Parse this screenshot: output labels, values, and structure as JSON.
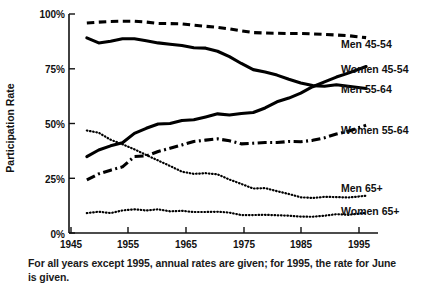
{
  "chart_data": {
    "type": "line",
    "title": "",
    "xlabel": "",
    "ylabel": "Participation Rate",
    "xlim": [
      1945,
      1997
    ],
    "ylim": [
      0,
      100
    ],
    "grid": false,
    "legend_position": "right-inline",
    "x_tick_labels": [
      "1945",
      "1955",
      "1965",
      "1975",
      "1985",
      "1995"
    ],
    "x_ticks": [
      1945,
      1955,
      1965,
      1975,
      1985,
      1995
    ],
    "y_tick_labels": [
      "0%",
      "25%",
      "50%",
      "75%",
      "100%"
    ],
    "y_ticks": [
      0,
      25,
      50,
      75,
      100
    ],
    "x": [
      1948,
      1950,
      1952,
      1954,
      1956,
      1958,
      1960,
      1962,
      1964,
      1966,
      1968,
      1970,
      1972,
      1974,
      1976,
      1978,
      1980,
      1982,
      1984,
      1986,
      1988,
      1990,
      1992,
      1995
    ],
    "series": [
      {
        "name": "Men 45-54",
        "style": "dashed",
        "values": [
          95.9,
          96.3,
          96.6,
          96.7,
          96.7,
          96.3,
          95.7,
          95.6,
          95.5,
          94.9,
          94.4,
          93.9,
          93.2,
          92.3,
          91.5,
          91.3,
          91.2,
          91.1,
          91.1,
          90.9,
          90.7,
          90.4,
          90.1,
          89.2
        ]
      },
      {
        "name": "Men 55-64",
        "style": "solid",
        "values": [
          89.1,
          86.8,
          87.6,
          88.7,
          88.7,
          87.8,
          86.8,
          86.2,
          85.6,
          84.6,
          84.4,
          83.0,
          80.5,
          77.4,
          74.6,
          73.5,
          72.1,
          70.2,
          68.5,
          67.3,
          67.0,
          67.7,
          67.0,
          66.0
        ]
      },
      {
        "name": "Women 45-54",
        "style": "solid",
        "values": [
          34.9,
          37.9,
          39.8,
          41.2,
          45.5,
          47.8,
          49.8,
          50.0,
          51.4,
          51.7,
          53.0,
          54.4,
          53.9,
          54.6,
          55.0,
          57.1,
          59.9,
          61.6,
          63.9,
          66.8,
          69.0,
          71.2,
          73.0,
          76.0
        ]
      },
      {
        "name": "Women 55-64",
        "style": "dashdot",
        "values": [
          24.3,
          27.0,
          28.7,
          30.2,
          34.9,
          35.2,
          37.2,
          38.7,
          40.2,
          41.8,
          42.4,
          43.0,
          42.1,
          40.7,
          41.0,
          41.3,
          41.3,
          41.8,
          41.7,
          42.3,
          43.5,
          45.2,
          46.5,
          49.2
        ]
      },
      {
        "name": "Men 65+",
        "style": "dotted",
        "values": [
          46.8,
          45.8,
          42.6,
          40.5,
          38.2,
          35.6,
          33.1,
          30.6,
          28.0,
          27.0,
          27.3,
          26.8,
          24.4,
          22.4,
          20.3,
          20.5,
          19.1,
          17.8,
          16.3,
          16.0,
          16.5,
          16.4,
          16.2,
          17.0
        ]
      },
      {
        "name": "Women 65+",
        "style": "dotted",
        "values": [
          9.1,
          9.7,
          9.1,
          10.3,
          10.8,
          10.3,
          10.8,
          9.9,
          10.1,
          9.6,
          9.6,
          9.7,
          9.3,
          8.2,
          8.2,
          8.3,
          8.1,
          7.9,
          7.5,
          7.4,
          7.9,
          8.6,
          8.3,
          9.2
        ]
      }
    ],
    "annotations": [
      {
        "text": "Men 45-54",
        "series": "Men 45-54"
      },
      {
        "text": "Women 45-54",
        "series": "Women 45-54"
      },
      {
        "text": "Men 55-64",
        "series": "Men 55-64"
      },
      {
        "text": "Women 55-64",
        "series": "Women 55-64"
      },
      {
        "text": "Men 65+",
        "series": "Men 65+"
      },
      {
        "text": "Women 65+",
        "series": "Women 65+"
      }
    ],
    "caption": "For all years except 1995, annual rates are given; for 1995, the rate for June is given."
  },
  "axis": {
    "y_title": "Participation Rate",
    "y_labels": [
      "100%",
      "75%",
      "50%",
      "25%",
      "0%"
    ],
    "x_labels": [
      "1945",
      "1955",
      "1965",
      "1975",
      "1985",
      "1995"
    ]
  },
  "labels": {
    "men_45_54": "Men 45-54",
    "women_45_54": "Women 45-54",
    "men_55_64": "Men 55-64",
    "women_55_64": "Women 55-64",
    "men_65plus": "Men 65+",
    "women_65plus": "Women 65+"
  },
  "caption": {
    "text": "For all years except 1995, annual rates are given; for 1995, the rate for June is given."
  },
  "colors": {
    "ink": "#111111",
    "background": "#ffffff"
  }
}
